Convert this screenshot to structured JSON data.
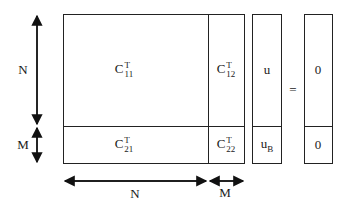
{
  "diagram": {
    "matrix": {
      "blocks": [
        {
          "id": "c11",
          "base": "C",
          "sup": "T",
          "sub": "11"
        },
        {
          "id": "c12",
          "base": "C",
          "sup": "T",
          "sub": "12"
        },
        {
          "id": "c21",
          "base": "C",
          "sup": "T",
          "sub": "21"
        },
        {
          "id": "c22",
          "base": "C",
          "sup": "T",
          "sub": "22"
        }
      ]
    },
    "vector_u": {
      "top": "u",
      "bottom_base": "u",
      "bottom_sub": "B"
    },
    "equals": "=",
    "rhs": {
      "top": "0",
      "bottom": "0"
    },
    "dimensions": {
      "vertical_top": "N",
      "vertical_bottom": "M",
      "horizontal_left": "N",
      "horizontal_right": "M"
    }
  }
}
